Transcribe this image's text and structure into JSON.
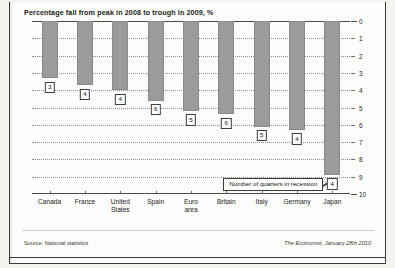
{
  "chart_data": {
    "type": "bar",
    "title": "Percentage fall from peak in 2008 to trough in 2009, %",
    "xlabel": "",
    "ylabel": "",
    "ylim": [
      0,
      10
    ],
    "y_inverted": true,
    "grid": true,
    "legend": "none",
    "categories": [
      "Canada",
      "France",
      "United\nStates",
      "Spain",
      "Euro\narea",
      "Britain",
      "Italy",
      "Germany",
      "Japan"
    ],
    "values": [
      3.3,
      3.7,
      4.0,
      4.6,
      5.2,
      5.4,
      6.1,
      6.3,
      8.9
    ],
    "quarters_in_recession": [
      3,
      4,
      4,
      6,
      5,
      6,
      5,
      4,
      4
    ],
    "y_ticks": [
      "0",
      "1",
      "2",
      "3",
      "4",
      "5",
      "6",
      "7",
      "8",
      "9",
      "10"
    ],
    "annotation": "Number of quarters in recession",
    "annotation_target": "Japan",
    "bar_color": "#9b9b9b",
    "background_color": "#fcfcfa"
  },
  "footer": {
    "source": "Source: National statistics",
    "credit": "The Economist, January 28th 2010"
  }
}
